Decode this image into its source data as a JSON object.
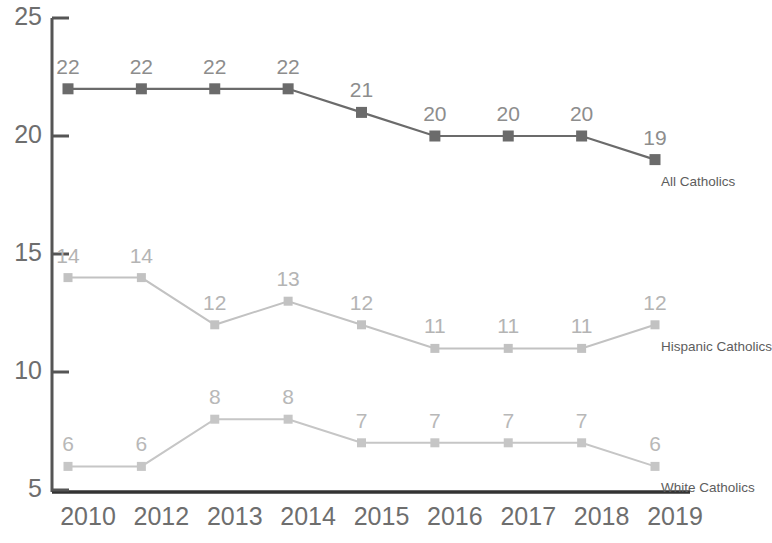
{
  "chart_data": {
    "type": "line",
    "title": "",
    "subtitle": "",
    "xlabel": "",
    "ylabel": "",
    "categories": [
      "2010",
      "2012",
      "2013",
      "2014",
      "2015",
      "2016",
      "2017",
      "2018",
      "2019"
    ],
    "ylim": [
      5,
      25
    ],
    "yticks": [
      5,
      10,
      15,
      20,
      25
    ],
    "ytick_labels": [
      "5",
      "10",
      "15",
      "20",
      "25"
    ],
    "grid": false,
    "legend_position": "end-of-line",
    "data_labels": true,
    "series": [
      {
        "name": "All Catholics",
        "color": "#6b6b6b",
        "values": [
          22,
          22,
          22,
          22,
          21,
          20,
          20,
          20,
          19
        ],
        "labels": [
          "22",
          "22",
          "22",
          "22",
          "21",
          "20",
          "20",
          "20",
          "19"
        ]
      },
      {
        "name": "Hispanic Catholics",
        "color": "#c2c2c2",
        "values": [
          14,
          14,
          12,
          13,
          12,
          11,
          11,
          11,
          12
        ],
        "labels": [
          "14",
          "14",
          "12",
          "13",
          "12",
          "11",
          "11",
          "11",
          "12"
        ]
      },
      {
        "name": "White Catholics",
        "color": "#c6c6c6",
        "values": [
          6,
          6,
          8,
          8,
          7,
          7,
          7,
          7,
          6
        ],
        "labels": [
          "6",
          "6",
          "8",
          "8",
          "7",
          "7",
          "7",
          "7",
          "6"
        ]
      }
    ]
  },
  "axes": {
    "y_labels": [
      "25",
      "20",
      "15",
      "10",
      "5"
    ],
    "x_labels": [
      "2010",
      "2012",
      "2013",
      "2014",
      "2015",
      "2016",
      "2017",
      "2018",
      "2019"
    ],
    "axis_color": "#555555"
  },
  "series_names": {
    "all": "All Catholics",
    "hispanic": "Hispanic Catholics",
    "white": "White Catholics"
  }
}
